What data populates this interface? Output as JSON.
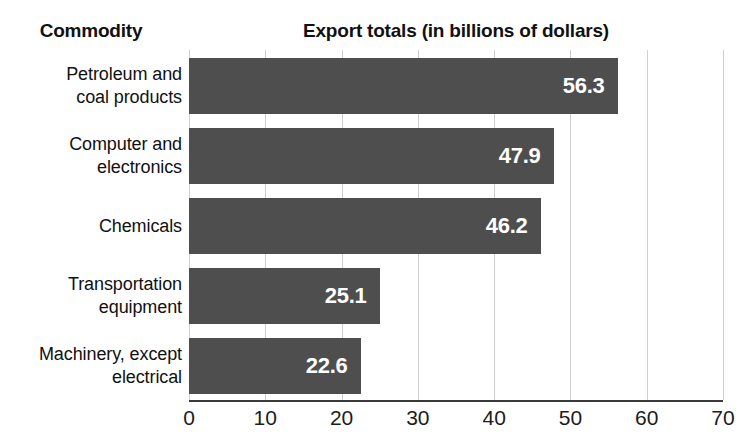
{
  "headers": {
    "category_header": "Commodity",
    "value_header": "Export totals (in billions of dollars)"
  },
  "chart_data": {
    "type": "bar",
    "orientation": "horizontal",
    "title": "Export totals (in billions of dollars)",
    "xlabel": "",
    "ylabel": "Commodity",
    "xlim": [
      0,
      70
    ],
    "xticks": [
      "0",
      "10",
      "20",
      "30",
      "40",
      "50",
      "60",
      "70"
    ],
    "xtick_values": [
      0,
      10,
      20,
      30,
      40,
      50,
      60,
      70
    ],
    "grid": true,
    "legend": "none",
    "bar_color": "#4e4e4e",
    "value_label_color": "#ffffff",
    "background_color": "#ffffff",
    "categories": [
      "Petroleum and coal products",
      "Computer and electronics",
      "Chemicals",
      "Transportation equipment",
      "Machinery, except electrical"
    ],
    "category_lines": [
      [
        "Petroleum and",
        "coal products"
      ],
      [
        "Computer and",
        "electronics"
      ],
      [
        "Chemicals"
      ],
      [
        "Transportation",
        "equipment"
      ],
      [
        "Machinery, except",
        "electrical"
      ]
    ],
    "values": [
      56.3,
      47.9,
      46.2,
      25.1,
      22.6
    ],
    "value_labels": [
      "56.3",
      "47.9",
      "46.2",
      "25.1",
      "22.6"
    ]
  }
}
